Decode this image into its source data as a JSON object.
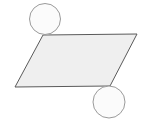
{
  "canvas": {
    "width": 145,
    "height": 124,
    "background_color": "#ffffff",
    "title": "Parallelogram with two tangent circles"
  },
  "palette": {
    "background": "#ffffff",
    "parallelogram_fill": "#efefef",
    "parallelogram_stroke": "#5a5a5a",
    "circle_fill": "#fbfbfb",
    "circle_stroke": "#9a9a9a"
  },
  "shapes": {
    "parallelogram": {
      "label": "parallelogram",
      "fill": "#efefef",
      "stroke": "#5a5a5a",
      "stroke_width": 1,
      "points": "43,35 137,34 110,86 15,87",
      "vertices": [
        {
          "name": "top-left",
          "x": 43,
          "y": 35
        },
        {
          "name": "top-right",
          "x": 137,
          "y": 34
        },
        {
          "name": "bottom-right",
          "x": 110,
          "y": 86
        },
        {
          "name": "bottom-left",
          "x": 15,
          "y": 87
        }
      ]
    },
    "circle_top_left": {
      "label": "top-left circle",
      "fill": "#fbfbfb",
      "stroke": "#9a9a9a",
      "stroke_width": 1,
      "cx": 45,
      "cy": 19,
      "r": 15.5
    },
    "circle_bottom_right": {
      "label": "bottom-right circle",
      "fill": "#fbfbfb",
      "stroke": "#9a9a9a",
      "stroke_width": 1,
      "cx": 109,
      "cy": 102,
      "r": 16
    }
  }
}
